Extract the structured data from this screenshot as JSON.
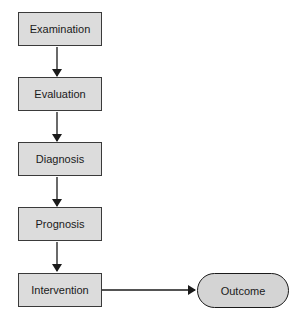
{
  "diagram": {
    "type": "flowchart",
    "nodes": [
      {
        "id": "examination",
        "label": "Examination",
        "shape": "rectangle"
      },
      {
        "id": "evaluation",
        "label": "Evaluation",
        "shape": "rectangle"
      },
      {
        "id": "diagnosis",
        "label": "Diagnosis",
        "shape": "rectangle"
      },
      {
        "id": "prognosis",
        "label": "Prognosis",
        "shape": "rectangle"
      },
      {
        "id": "intervention",
        "label": "Intervention",
        "shape": "rectangle"
      },
      {
        "id": "outcome",
        "label": "Outcome",
        "shape": "rounded"
      }
    ],
    "edges": [
      {
        "from": "examination",
        "to": "evaluation"
      },
      {
        "from": "evaluation",
        "to": "diagnosis"
      },
      {
        "from": "diagnosis",
        "to": "prognosis"
      },
      {
        "from": "prognosis",
        "to": "intervention"
      },
      {
        "from": "intervention",
        "to": "outcome"
      }
    ],
    "colors": {
      "box_fill": "#dcdcdc",
      "pill_fill": "#d4d4d4",
      "stroke": "#1a1a1a"
    }
  }
}
